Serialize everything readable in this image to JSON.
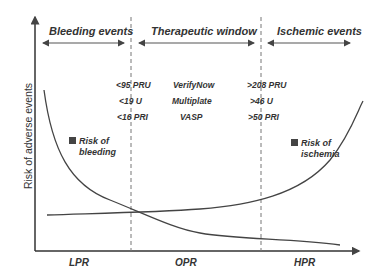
{
  "diagram": {
    "y_axis_label": "Risk of adverse events",
    "headers": {
      "bleeding": "Bleeding events",
      "therapeutic": "Therapeutic window",
      "ischemic": "Ischemic events"
    },
    "thresholds": {
      "low": [
        "<95 PRU",
        "<19 U",
        "<16 PRI"
      ],
      "assays": [
        "VerifyNow",
        "Multiplate",
        "VASP"
      ],
      "high": [
        ">208 PRU",
        ">46 U",
        ">50 PRI"
      ]
    },
    "legend": {
      "bleeding": {
        "line1": "Risk of",
        "line2": "bleeding"
      },
      "ischemia": {
        "line1": "Risk of",
        "line2": "ischemia"
      }
    },
    "regions": {
      "low": "LPR",
      "optimal": "OPR",
      "high": "HPR"
    },
    "colors": {
      "line": "#444444",
      "text": "#333333",
      "dash": "#777777"
    }
  }
}
